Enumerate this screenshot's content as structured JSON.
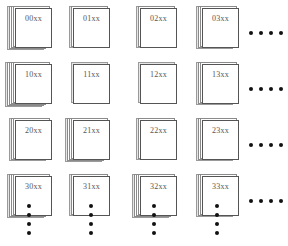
{
  "diagram": {
    "grid": [
      [
        {
          "label": "00xx",
          "layers": 5
        },
        {
          "label": "01xx",
          "layers": 3
        },
        {
          "label": "02xx",
          "layers": 3
        },
        {
          "label": "03xx",
          "layers": 4
        }
      ],
      [
        {
          "label": "10xx",
          "layers": 6
        },
        {
          "label": "11xx",
          "layers": 2
        },
        {
          "label": "12xx",
          "layers": 2
        },
        {
          "label": "13xx",
          "layers": 4
        }
      ],
      [
        {
          "label": "20xx",
          "layers": 4
        },
        {
          "label": "21xx",
          "layers": 5
        },
        {
          "label": "22xx",
          "layers": 3
        },
        {
          "label": "23xx",
          "layers": 4
        }
      ],
      [
        {
          "label": "30xx",
          "layers": 5
        },
        {
          "label": "31xx",
          "layers": 3
        },
        {
          "label": "32xx",
          "layers": 5
        },
        {
          "label": "33xx",
          "layers": 4
        }
      ]
    ],
    "continuation": {
      "horizontal_dots": 4,
      "vertical_dots": 4,
      "icon": "ellipsis-dots"
    }
  }
}
